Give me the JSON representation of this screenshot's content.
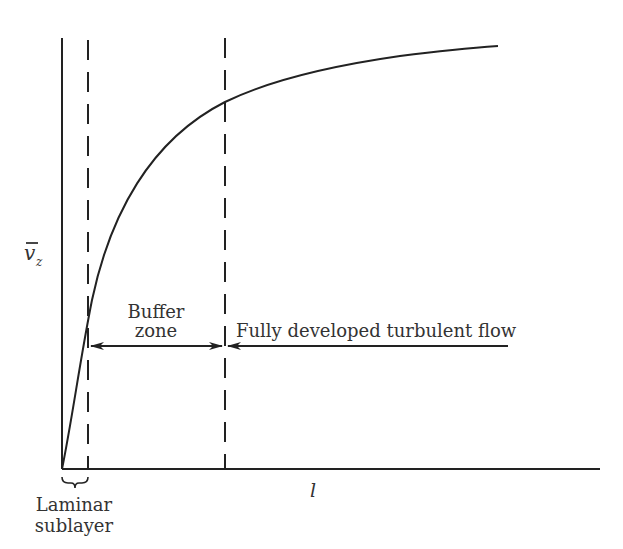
{
  "diagram": {
    "y_axis": {
      "label_main": "v",
      "label_sub": "z",
      "overbar": true
    },
    "x_axis": {
      "label": "l"
    },
    "regions": [
      {
        "id": "laminar",
        "label_line1": "Laminar",
        "label_line2": "sublayer"
      },
      {
        "id": "buffer",
        "label_line1": "Buffer",
        "label_line2": "zone"
      },
      {
        "id": "turbulent",
        "label": "Fully developed turbulent flow"
      }
    ],
    "colors": {
      "stroke": "#222222",
      "text": "#333333",
      "background": "#ffffff"
    }
  }
}
